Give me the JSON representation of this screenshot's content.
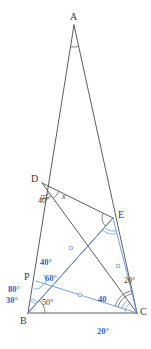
{
  "figure": {
    "type": "geometry-diagram",
    "colors": {
      "stroke_black": "#4a4a4a",
      "stroke_blue": "#5b8fd4",
      "text_black": "#3a3a3a",
      "text_blue": "#2f63c4",
      "background": "#ffffff"
    },
    "points": [
      {
        "name": "A",
        "x": 74,
        "y": 25,
        "label": "A",
        "label_x": 70,
        "label_y": 12
      },
      {
        "name": "D",
        "x": 42,
        "y": 183,
        "label": "D",
        "label_x": 31,
        "label_y": 174
      },
      {
        "name": "E",
        "x": 113,
        "y": 218,
        "label": "E",
        "label_x": 118,
        "label_y": 210
      },
      {
        "name": "P",
        "x": 36,
        "y": 281,
        "label": "P",
        "label_x": 24,
        "label_y": 272
      },
      {
        "name": "B",
        "x": 28,
        "y": 313,
        "label": "B",
        "label_x": 20,
        "label_y": 316
      },
      {
        "name": "C",
        "x": 137,
        "y": 313,
        "label": "C",
        "label_x": 140,
        "label_y": 307
      }
    ],
    "segments_black": [
      {
        "name": "side-AB",
        "from": "A",
        "to": "B"
      },
      {
        "name": "side-AC",
        "from": "A",
        "to": "C"
      },
      {
        "name": "side-BC",
        "from": "B",
        "to": "C"
      },
      {
        "name": "segment-DE",
        "from": "D",
        "to": "E"
      },
      {
        "name": "cevian-DC",
        "from": "D",
        "to": "C"
      },
      {
        "name": "cevian-BE",
        "from": "B",
        "to": "E"
      }
    ],
    "segments_blue": [
      {
        "name": "segment-PC",
        "from": "P",
        "to": "C"
      },
      {
        "name": "segment-BE-blue",
        "from": "B",
        "to": "E"
      },
      {
        "name": "segment-EC",
        "from": "E",
        "to": "C"
      }
    ],
    "tick_marks": [
      {
        "name": "tick-on-BE",
        "x": 71,
        "y": 248
      },
      {
        "name": "tick-on-EC",
        "x": 118,
        "y": 266
      },
      {
        "name": "tick-on-PC",
        "x": 80,
        "y": 295
      }
    ],
    "angle_labels": [
      {
        "name": "angle-D-40",
        "text": "40°",
        "color": "black",
        "x": 38,
        "y": 197
      },
      {
        "name": "angle-D-x",
        "text": "x",
        "color": "black",
        "x": 62,
        "y": 193,
        "italic": true
      },
      {
        "name": "angle-B-50",
        "text": "50°",
        "color": "black",
        "x": 42,
        "y": 299
      },
      {
        "name": "angle-C-20-right",
        "text": "20°",
        "color": "black",
        "x": 124,
        "y": 277
      },
      {
        "name": "angle-P-40",
        "text": "40°",
        "color": "blue",
        "x": 40,
        "y": 258
      },
      {
        "name": "angle-P-60",
        "text": "60°",
        "color": "blue",
        "x": 45,
        "y": 274
      },
      {
        "name": "angle-B-80",
        "text": "80°",
        "color": "blue",
        "x": 8,
        "y": 285
      },
      {
        "name": "angle-B-30",
        "text": "30°",
        "color": "blue",
        "x": 6,
        "y": 296
      },
      {
        "name": "angle-C-40",
        "text": "40",
        "color": "blue",
        "x": 98,
        "y": 295
      },
      {
        "name": "angle-C-20-below",
        "text": "20°",
        "color": "blue",
        "x": 97,
        "y": 327
      }
    ]
  }
}
